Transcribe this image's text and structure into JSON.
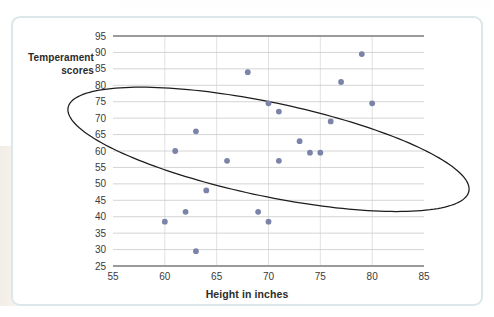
{
  "figure": {
    "y_axis_title_line1": "Temperament",
    "y_axis_title_line2": "scores",
    "x_axis_title": "Height in inches"
  },
  "chart_data": {
    "type": "scatter",
    "title": "",
    "xlabel": "Height in inches",
    "ylabel": "Temperament scores",
    "xlim": [
      55,
      85
    ],
    "ylim": [
      25,
      95
    ],
    "xticks": [
      55,
      60,
      65,
      70,
      75,
      80,
      85
    ],
    "yticks": [
      25,
      30,
      35,
      40,
      45,
      50,
      55,
      60,
      65,
      70,
      75,
      80,
      85,
      90,
      95
    ],
    "grid": "horizontal-and-vertical",
    "legend": "none",
    "point_color": "#7b83a8",
    "annotation_color": "#1d1d1d",
    "annotations": [
      {
        "type": "ellipse",
        "label": "correlation-envelope",
        "center_x": 70,
        "center_y": 60.5,
        "semi_major": 24.5,
        "semi_minor": 11.5,
        "rotation_deg": -44
      }
    ],
    "points": [
      {
        "x": 60,
        "y": 38.5
      },
      {
        "x": 61,
        "y": 60.0
      },
      {
        "x": 62,
        "y": 41.5
      },
      {
        "x": 63,
        "y": 29.5
      },
      {
        "x": 63,
        "y": 66.0
      },
      {
        "x": 64,
        "y": 48.0
      },
      {
        "x": 66,
        "y": 57.0
      },
      {
        "x": 68,
        "y": 84.0
      },
      {
        "x": 69,
        "y": 41.5
      },
      {
        "x": 70,
        "y": 38.5
      },
      {
        "x": 70,
        "y": 74.5
      },
      {
        "x": 71,
        "y": 57.0
      },
      {
        "x": 71,
        "y": 72.0
      },
      {
        "x": 73,
        "y": 63.0
      },
      {
        "x": 74,
        "y": 59.5
      },
      {
        "x": 75,
        "y": 59.5
      },
      {
        "x": 76,
        "y": 69.0
      },
      {
        "x": 77,
        "y": 81.0
      },
      {
        "x": 79,
        "y": 89.5
      },
      {
        "x": 80,
        "y": 74.5
      }
    ]
  }
}
